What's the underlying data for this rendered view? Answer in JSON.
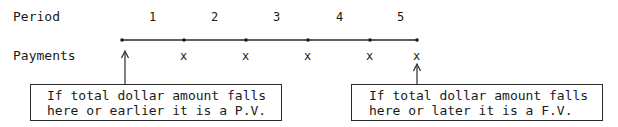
{
  "row_labels": {
    "period": "Period",
    "payments": "Payments"
  },
  "periods": [
    "1",
    "2",
    "3",
    "4",
    "5"
  ],
  "payments": [
    "x",
    "x",
    "x",
    "x",
    "x"
  ],
  "timeline": {
    "points_x": [
      122,
      184,
      246,
      308,
      370,
      417
    ],
    "y": 40
  },
  "callouts": {
    "left": {
      "line1": "If total dollar amount falls",
      "line2": "here or earlier it is a P.V."
    },
    "right": {
      "line1": "If total dollar amount falls",
      "line2": "here or later it is a F.V."
    }
  },
  "colors": {
    "ink": "#1a1a1a",
    "background": "#ffffff"
  }
}
